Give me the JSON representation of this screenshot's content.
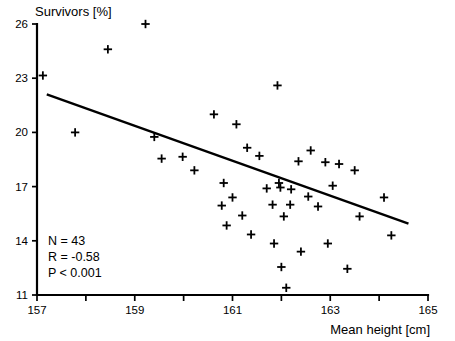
{
  "chart_data": {
    "type": "scatter",
    "title": "",
    "ylabel": "Survivors [%]",
    "xlabel": "Mean height [cm]",
    "xlim": [
      157,
      165
    ],
    "ylim": [
      11,
      26
    ],
    "xticks": [
      157,
      158,
      159,
      160,
      161,
      162,
      163,
      164,
      165
    ],
    "xtick_labels": [
      "157",
      "",
      "159",
      "",
      "161",
      "",
      "163",
      "",
      "165"
    ],
    "yticks": [
      11,
      14,
      17,
      20,
      23,
      26
    ],
    "ytick_labels": [
      "11",
      "14",
      "17",
      "20",
      "23",
      "26"
    ],
    "grid": false,
    "legend": null,
    "marker": "plus",
    "marker_color": "#000000",
    "n_points": 43,
    "points": [
      {
        "x": 157.12,
        "y": 23.15
      },
      {
        "x": 157.78,
        "y": 20.0
      },
      {
        "x": 158.45,
        "y": 24.6
      },
      {
        "x": 159.22,
        "y": 26.0
      },
      {
        "x": 159.4,
        "y": 19.75
      },
      {
        "x": 159.55,
        "y": 18.55
      },
      {
        "x": 159.98,
        "y": 18.65
      },
      {
        "x": 160.22,
        "y": 17.9
      },
      {
        "x": 160.62,
        "y": 21.0
      },
      {
        "x": 160.78,
        "y": 15.95
      },
      {
        "x": 160.82,
        "y": 17.2
      },
      {
        "x": 160.88,
        "y": 14.85
      },
      {
        "x": 161.0,
        "y": 16.4
      },
      {
        "x": 161.08,
        "y": 20.45
      },
      {
        "x": 161.2,
        "y": 15.4
      },
      {
        "x": 161.3,
        "y": 19.15
      },
      {
        "x": 161.38,
        "y": 14.35
      },
      {
        "x": 161.55,
        "y": 18.7
      },
      {
        "x": 161.7,
        "y": 16.9
      },
      {
        "x": 161.82,
        "y": 16.0
      },
      {
        "x": 161.85,
        "y": 13.85
      },
      {
        "x": 161.92,
        "y": 22.6
      },
      {
        "x": 161.95,
        "y": 17.2
      },
      {
        "x": 161.98,
        "y": 16.95
      },
      {
        "x": 162.0,
        "y": 12.55
      },
      {
        "x": 162.05,
        "y": 15.35
      },
      {
        "x": 162.1,
        "y": 11.4
      },
      {
        "x": 162.18,
        "y": 16.0
      },
      {
        "x": 162.2,
        "y": 16.85
      },
      {
        "x": 162.35,
        "y": 18.4
      },
      {
        "x": 162.4,
        "y": 13.4
      },
      {
        "x": 162.55,
        "y": 16.45
      },
      {
        "x": 162.6,
        "y": 19.0
      },
      {
        "x": 162.75,
        "y": 15.9
      },
      {
        "x": 162.9,
        "y": 18.35
      },
      {
        "x": 162.95,
        "y": 13.85
      },
      {
        "x": 163.05,
        "y": 17.05
      },
      {
        "x": 163.18,
        "y": 18.25
      },
      {
        "x": 163.35,
        "y": 12.45
      },
      {
        "x": 163.5,
        "y": 17.9
      },
      {
        "x": 163.6,
        "y": 15.35
      },
      {
        "x": 164.1,
        "y": 16.4
      },
      {
        "x": 164.25,
        "y": 14.3
      }
    ],
    "regression_line": {
      "x_start": 157.2,
      "y_start": 22.1,
      "x_end": 164.6,
      "y_end": 14.95
    },
    "annotations": {
      "n_label": "N = 43",
      "r_label": "R = -0.58",
      "p_label": "P < 0.001"
    }
  }
}
